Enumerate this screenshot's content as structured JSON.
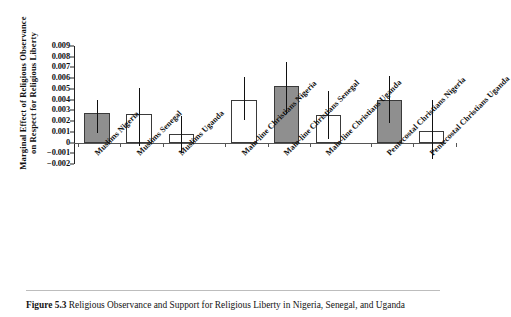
{
  "figure": {
    "caption_label": "Figure 5.3",
    "caption_text": "Religious Observance and Support for Religious Liberty in Nigeria, Senegal, and Uganda"
  },
  "chart_data": {
    "type": "bar",
    "title": "",
    "xlabel": "",
    "ylabel_line1": "Marginal Effect of Religious Observance",
    "ylabel_line2": "on Respect for Religious Liberty",
    "ylim": [
      -0.002,
      0.009
    ],
    "ytick_values": [
      0.009,
      0.008,
      0.007,
      0.006,
      0.005,
      0.004,
      0.003,
      0.002,
      0.001,
      0,
      -0.001,
      -0.002
    ],
    "ytick_labels": [
      "0.009",
      "0.008",
      "0.007",
      "0.006",
      "0.005",
      "0.004",
      "0.003",
      "0.002",
      "0.001",
      "0",
      "−0.001",
      "−0.002"
    ],
    "grid": false,
    "legend": "none",
    "zero_reference_line": 0,
    "categories": [
      "Muslims Nigeria",
      "Muslims Senegal",
      "Muslims Uganda",
      "Main-line Christians Nigeria",
      "Main-line Christians Senegal",
      "Main-line Christians Uganda",
      "Pentecostal Christians Nigeria",
      "Pentecostal Christians Uganda"
    ],
    "values": [
      0.0028,
      0.0027,
      0.0008,
      0.004,
      0.0053,
      0.0026,
      0.004,
      0.0011
    ],
    "ci_lower": [
      0.0009,
      -0.0003,
      -0.001,
      0.0021,
      0.0027,
      0.0003,
      0.0018,
      -0.0015
    ],
    "ci_upper": [
      0.004,
      0.0051,
      0.0025,
      0.0061,
      0.0075,
      0.0048,
      0.0062,
      0.004
    ],
    "fill": [
      "filled",
      "open",
      "open",
      "open",
      "filled",
      "open",
      "filled",
      "open"
    ],
    "fill_color": "#8f8f8f",
    "open_color": "#ffffff",
    "edge_color": "#3a3a3a",
    "error_color": "#111111",
    "series_name": "Marginal effect"
  }
}
